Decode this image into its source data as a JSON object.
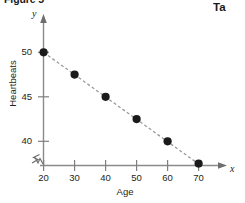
{
  "figure": {
    "caption": "Figure 5",
    "side_caption": "Ta"
  },
  "chart_data": {
    "type": "scatter",
    "title": "",
    "xlabel": "Age",
    "ylabel": "Heartbeats",
    "x_axis_symbol": "x",
    "y_axis_symbol": "y",
    "x": [
      20,
      30,
      40,
      50,
      60,
      70
    ],
    "values": [
      50,
      47.5,
      45,
      42.5,
      40,
      37.5
    ],
    "series": [
      {
        "name": "Heartbeats vs Age",
        "values": [
          50,
          47.5,
          45,
          42.5,
          40,
          37.5
        ]
      }
    ],
    "xticks": [
      20,
      30,
      40,
      50,
      60,
      70
    ],
    "xtick_labels": [
      "20",
      "30",
      "40",
      "50",
      "60",
      "70"
    ],
    "yticks": [
      40,
      45,
      50
    ],
    "ytick_labels": [
      "40",
      "45",
      "50"
    ],
    "xlim": [
      20,
      74
    ],
    "ylim": [
      36.9,
      51.2
    ],
    "grid": false,
    "legend": false,
    "trendline": {
      "style": "dashed",
      "color": "#9a9a9a",
      "from": [
        20,
        50
      ],
      "to": [
        71,
        37.2
      ]
    },
    "marker": {
      "shape": "circle",
      "color": "#1a1a1a",
      "size": 7
    },
    "axis_break": true,
    "axis_color": "#7f7f7f"
  }
}
